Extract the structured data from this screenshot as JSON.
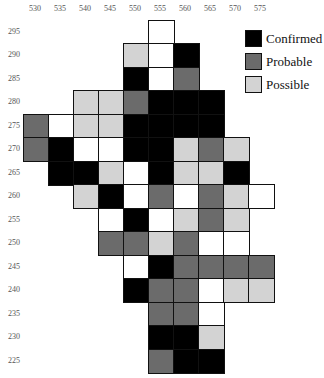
{
  "chart_data": {
    "type": "heatmap",
    "title": "",
    "xlabel": "",
    "ylabel": "",
    "x_ticks": [
      530,
      535,
      540,
      545,
      550,
      555,
      560,
      565,
      570,
      575
    ],
    "y_ticks": [
      295,
      290,
      285,
      280,
      275,
      270,
      265,
      260,
      255,
      250,
      245,
      240,
      235,
      230,
      225
    ],
    "legend": [
      {
        "label": "Confirmed",
        "color": "#000000"
      },
      {
        "label": "Probable",
        "color": "#6b6b6b"
      },
      {
        "label": "Possible",
        "color": "#d3d3d3"
      }
    ],
    "colors": {
      "confirmed": "#000000",
      "probable": "#6b6b6b",
      "possible": "#d3d3d3",
      "none": "#ffffff"
    },
    "cells": [
      {
        "x": 555,
        "y": 295,
        "v": "none"
      },
      {
        "x": 550,
        "y": 290,
        "v": "possible"
      },
      {
        "x": 555,
        "y": 290,
        "v": "none"
      },
      {
        "x": 560,
        "y": 290,
        "v": "confirmed"
      },
      {
        "x": 550,
        "y": 285,
        "v": "confirmed"
      },
      {
        "x": 555,
        "y": 285,
        "v": "none"
      },
      {
        "x": 560,
        "y": 285,
        "v": "probable"
      },
      {
        "x": 540,
        "y": 280,
        "v": "possible"
      },
      {
        "x": 545,
        "y": 280,
        "v": "possible"
      },
      {
        "x": 550,
        "y": 280,
        "v": "probable"
      },
      {
        "x": 555,
        "y": 280,
        "v": "confirmed"
      },
      {
        "x": 560,
        "y": 280,
        "v": "confirmed"
      },
      {
        "x": 565,
        "y": 280,
        "v": "confirmed"
      },
      {
        "x": 530,
        "y": 275,
        "v": "probable"
      },
      {
        "x": 535,
        "y": 275,
        "v": "none"
      },
      {
        "x": 540,
        "y": 275,
        "v": "possible"
      },
      {
        "x": 545,
        "y": 275,
        "v": "possible"
      },
      {
        "x": 550,
        "y": 275,
        "v": "confirmed"
      },
      {
        "x": 555,
        "y": 275,
        "v": "confirmed"
      },
      {
        "x": 560,
        "y": 275,
        "v": "confirmed"
      },
      {
        "x": 565,
        "y": 275,
        "v": "confirmed"
      },
      {
        "x": 530,
        "y": 270,
        "v": "probable"
      },
      {
        "x": 535,
        "y": 270,
        "v": "confirmed"
      },
      {
        "x": 540,
        "y": 270,
        "v": "none"
      },
      {
        "x": 545,
        "y": 270,
        "v": "none"
      },
      {
        "x": 550,
        "y": 270,
        "v": "confirmed"
      },
      {
        "x": 555,
        "y": 270,
        "v": "confirmed"
      },
      {
        "x": 560,
        "y": 270,
        "v": "possible"
      },
      {
        "x": 565,
        "y": 270,
        "v": "probable"
      },
      {
        "x": 570,
        "y": 270,
        "v": "possible"
      },
      {
        "x": 535,
        "y": 265,
        "v": "confirmed"
      },
      {
        "x": 540,
        "y": 265,
        "v": "confirmed"
      },
      {
        "x": 545,
        "y": 265,
        "v": "possible"
      },
      {
        "x": 550,
        "y": 265,
        "v": "none"
      },
      {
        "x": 555,
        "y": 265,
        "v": "confirmed"
      },
      {
        "x": 560,
        "y": 265,
        "v": "possible"
      },
      {
        "x": 565,
        "y": 265,
        "v": "possible"
      },
      {
        "x": 570,
        "y": 265,
        "v": "confirmed"
      },
      {
        "x": 540,
        "y": 260,
        "v": "possible"
      },
      {
        "x": 545,
        "y": 260,
        "v": "confirmed"
      },
      {
        "x": 550,
        "y": 260,
        "v": "none"
      },
      {
        "x": 555,
        "y": 260,
        "v": "probable"
      },
      {
        "x": 560,
        "y": 260,
        "v": "none"
      },
      {
        "x": 565,
        "y": 260,
        "v": "probable"
      },
      {
        "x": 570,
        "y": 260,
        "v": "possible"
      },
      {
        "x": 575,
        "y": 260,
        "v": "none"
      },
      {
        "x": 545,
        "y": 255,
        "v": "none"
      },
      {
        "x": 550,
        "y": 255,
        "v": "confirmed"
      },
      {
        "x": 555,
        "y": 255,
        "v": "none"
      },
      {
        "x": 560,
        "y": 255,
        "v": "possible"
      },
      {
        "x": 565,
        "y": 255,
        "v": "probable"
      },
      {
        "x": 570,
        "y": 255,
        "v": "possible"
      },
      {
        "x": 545,
        "y": 250,
        "v": "probable"
      },
      {
        "x": 550,
        "y": 250,
        "v": "probable"
      },
      {
        "x": 555,
        "y": 250,
        "v": "possible"
      },
      {
        "x": 560,
        "y": 250,
        "v": "probable"
      },
      {
        "x": 565,
        "y": 250,
        "v": "none"
      },
      {
        "x": 570,
        "y": 250,
        "v": "none"
      },
      {
        "x": 550,
        "y": 245,
        "v": "none"
      },
      {
        "x": 555,
        "y": 245,
        "v": "confirmed"
      },
      {
        "x": 560,
        "y": 245,
        "v": "probable"
      },
      {
        "x": 565,
        "y": 245,
        "v": "probable"
      },
      {
        "x": 570,
        "y": 245,
        "v": "probable"
      },
      {
        "x": 575,
        "y": 245,
        "v": "probable"
      },
      {
        "x": 550,
        "y": 240,
        "v": "confirmed"
      },
      {
        "x": 555,
        "y": 240,
        "v": "probable"
      },
      {
        "x": 560,
        "y": 240,
        "v": "probable"
      },
      {
        "x": 565,
        "y": 240,
        "v": "none"
      },
      {
        "x": 570,
        "y": 240,
        "v": "possible"
      },
      {
        "x": 575,
        "y": 240,
        "v": "possible"
      },
      {
        "x": 555,
        "y": 235,
        "v": "probable"
      },
      {
        "x": 560,
        "y": 235,
        "v": "probable"
      },
      {
        "x": 565,
        "y": 235,
        "v": "none"
      },
      {
        "x": 555,
        "y": 230,
        "v": "confirmed"
      },
      {
        "x": 560,
        "y": 230,
        "v": "confirmed"
      },
      {
        "x": 565,
        "y": 230,
        "v": "possible"
      },
      {
        "x": 555,
        "y": 225,
        "v": "probable"
      },
      {
        "x": 560,
        "y": 225,
        "v": "confirmed"
      },
      {
        "x": 565,
        "y": 225,
        "v": "confirmed"
      }
    ]
  },
  "legend": {
    "items": [
      "Confirmed",
      "Probable",
      "Possible"
    ]
  }
}
